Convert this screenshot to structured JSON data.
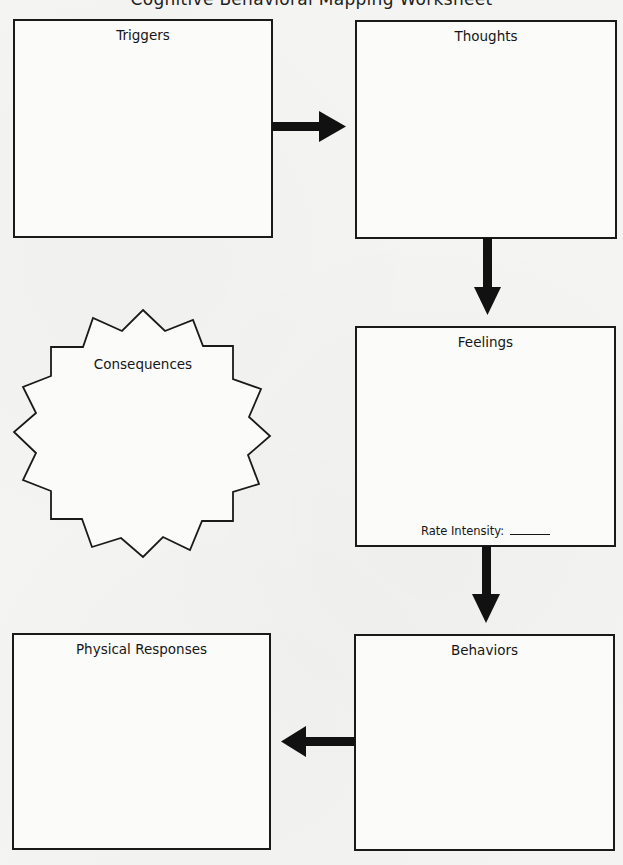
{
  "page": {
    "cut_off_title": "Cognitive Behavioral Mapping Worksheet"
  },
  "boxes": {
    "triggers": {
      "label": "Triggers"
    },
    "thoughts": {
      "label": "Thoughts"
    },
    "feelings": {
      "label": "Feelings",
      "rate_label": "Rate Intensity:",
      "rate_value": ""
    },
    "behaviors": {
      "label": "Behaviors"
    },
    "physical_responses": {
      "label": "Physical Responses"
    }
  },
  "starburst": {
    "label": "Consequences"
  },
  "arrows": [
    {
      "from": "Triggers",
      "to": "Thoughts",
      "direction": "right"
    },
    {
      "from": "Thoughts",
      "to": "Feelings",
      "direction": "down"
    },
    {
      "from": "Feelings",
      "to": "Behaviors",
      "direction": "down"
    },
    {
      "from": "Behaviors",
      "to": "Physical Responses",
      "direction": "left"
    }
  ],
  "colors": {
    "stroke": "#1a1a1a",
    "paper": "#f4f4f2",
    "fill": "#fbfbfa"
  }
}
